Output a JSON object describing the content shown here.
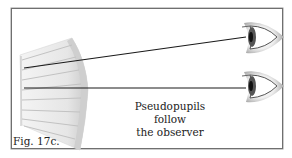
{
  "figure": {
    "label": "Fig. 17c.",
    "caption_line1": "Pseudopupils follow",
    "caption_line2": "the observer",
    "elements": {
      "left_object": "ommatidia-fan-illustration",
      "right_objects": [
        "eye-upper",
        "eye-lower"
      ],
      "sight_lines": [
        {
          "from": [
            24,
            68
          ],
          "to": [
            246,
            37
          ]
        },
        {
          "from": [
            24,
            88
          ],
          "to": [
            246,
            88
          ]
        }
      ]
    },
    "colors": {
      "border": "#6f6f6f",
      "line": "#1a1a1a",
      "text": "#222222",
      "illustration_gray": "#c8c8c8"
    }
  }
}
